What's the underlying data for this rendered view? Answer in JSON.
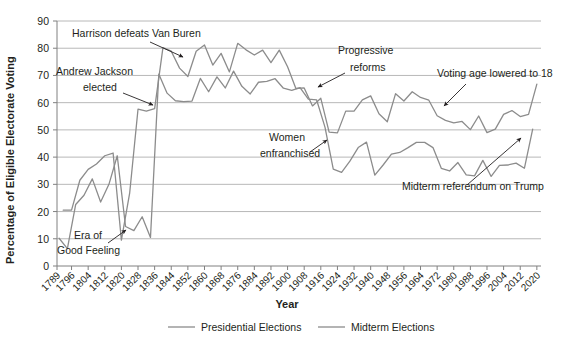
{
  "chart_data": {
    "type": "line",
    "title": "",
    "xlabel": "Year",
    "ylabel": "Percentage of Eligible Electorate Voting",
    "ylim": [
      0,
      90
    ],
    "ytick_step": 10,
    "yticks": [
      0,
      10,
      20,
      30,
      40,
      50,
      60,
      70,
      80,
      90
    ],
    "xlim": [
      1789,
      2022
    ],
    "xticks": [
      1789,
      1796,
      1804,
      1812,
      1820,
      1828,
      1836,
      1844,
      1852,
      1860,
      1868,
      1876,
      1884,
      1892,
      1900,
      1908,
      1916,
      1924,
      1932,
      1940,
      1948,
      1956,
      1964,
      1972,
      1980,
      1988,
      1996,
      2004,
      2012,
      2020
    ],
    "grid": "horizontal",
    "legend_position": "bottom",
    "series": [
      {
        "name": "Presidential Elections",
        "color": "#8c8c8c",
        "x": [
          1792,
          1796,
          1800,
          1804,
          1808,
          1812,
          1816,
          1820,
          1824,
          1828,
          1832,
          1836,
          1840,
          1844,
          1848,
          1852,
          1856,
          1860,
          1864,
          1868,
          1872,
          1876,
          1880,
          1884,
          1888,
          1892,
          1896,
          1900,
          1904,
          1908,
          1912,
          1916,
          1920,
          1924,
          1928,
          1932,
          1936,
          1940,
          1944,
          1948,
          1952,
          1956,
          1960,
          1964,
          1968,
          1972,
          1976,
          1980,
          1984,
          1988,
          1992,
          1996,
          2000,
          2004,
          2008,
          2012,
          2016,
          2020
        ],
        "y": [
          20.5,
          20.5,
          31.5,
          35.5,
          37.5,
          40.5,
          41.5,
          9.5,
          26.9,
          57.6,
          56.9,
          57.8,
          80.2,
          78.9,
          72.7,
          69.6,
          78.9,
          81.2,
          73.8,
          78.1,
          71.3,
          81.8,
          79.4,
          77.5,
          79.3,
          74.7,
          79.3,
          73.2,
          65.2,
          65.4,
          58.8,
          61.6,
          49.2,
          48.9,
          56.9,
          56.9,
          61.0,
          62.5,
          55.9,
          53.0,
          63.3,
          60.6,
          64.0,
          61.9,
          60.9,
          55.2,
          53.5,
          52.6,
          53.1,
          50.1,
          55.1,
          49.0,
          50.3,
          55.7,
          57.1,
          54.9,
          55.7,
          66.8
        ]
      },
      {
        "name": "Midterm Elections",
        "color": "#8c8c8c",
        "x": [
          1790,
          1794,
          1798,
          1802,
          1806,
          1810,
          1814,
          1818,
          1822,
          1826,
          1830,
          1834,
          1838,
          1842,
          1846,
          1850,
          1854,
          1858,
          1862,
          1866,
          1870,
          1874,
          1878,
          1882,
          1886,
          1890,
          1894,
          1898,
          1902,
          1906,
          1910,
          1914,
          1918,
          1922,
          1926,
          1930,
          1934,
          1938,
          1942,
          1946,
          1950,
          1954,
          1958,
          1962,
          1966,
          1970,
          1974,
          1978,
          1982,
          1986,
          1990,
          1994,
          1998,
          2002,
          2006,
          2010,
          2014,
          2018
        ],
        "y": [
          10.2,
          6.4,
          22.6,
          26.0,
          32.0,
          23.5,
          30.0,
          40.5,
          14.5,
          13.0,
          18.1,
          10.5,
          70.5,
          63.5,
          60.7,
          60.4,
          60.6,
          68.9,
          64.0,
          69.5,
          65.4,
          71.6,
          66.0,
          63.2,
          67.5,
          67.8,
          68.8,
          65.3,
          64.5,
          65.5,
          61.3,
          61.0,
          51.0,
          35.6,
          34.4,
          38.5,
          43.5,
          45.5,
          33.4,
          37.1,
          41.1,
          41.7,
          43.5,
          45.4,
          45.4,
          43.5,
          35.9,
          34.9,
          38.0,
          33.5,
          33.1,
          38.8,
          32.9,
          37.0,
          37.1,
          37.8,
          35.9,
          50.3
        ]
      }
    ],
    "annotations": [
      {
        "id": "harrison",
        "text": "Harrison defeats Van Buren",
        "x_px": 72,
        "y_px": 37
      },
      {
        "id": "jackson-line1",
        "text": "Andrew Jackson",
        "x_px": 56,
        "y_px": 75
      },
      {
        "id": "jackson-line2",
        "text": "elected",
        "x_px": 83,
        "y_px": 91
      },
      {
        "id": "era-line1",
        "text": "Era of",
        "x_px": 74,
        "y_px": 239
      },
      {
        "id": "era-line2",
        "text": "Good Feeling",
        "x_px": 57,
        "y_px": 254
      },
      {
        "id": "women-line1",
        "text": "Women",
        "x_px": 269,
        "y_px": 141
      },
      {
        "id": "women-line2",
        "text": "enfranchised",
        "x_px": 260,
        "y_px": 157
      },
      {
        "id": "progressive-line1",
        "text": "Progressive",
        "x_px": 338,
        "y_px": 54
      },
      {
        "id": "progressive-line2",
        "text": "reforms",
        "x_px": 350,
        "y_px": 71
      },
      {
        "id": "voting-age",
        "text": "Voting age lowered to 18",
        "x_px": 437,
        "y_px": 77
      },
      {
        "id": "trump",
        "text": "Midterm referendum on Trump",
        "x_px": 402,
        "y_px": 190
      }
    ],
    "legend": [
      {
        "label": "Presidential Elections"
      },
      {
        "label": "Midterm Elections"
      }
    ]
  },
  "axis": {
    "ylabel": "Percentage of Eligible Electorate Voting",
    "xlabel": "Year",
    "yticks": [
      "90",
      "80",
      "70",
      "60",
      "50",
      "40",
      "30",
      "20",
      "10",
      "0"
    ],
    "xticks": [
      "1789",
      "1796",
      "1804",
      "1812",
      "1820",
      "1828",
      "1836",
      "1844",
      "1852",
      "1860",
      "1868",
      "1876",
      "1884",
      "1892",
      "1900",
      "1908",
      "1916",
      "1924",
      "1932",
      "1940",
      "1948",
      "1956",
      "1964",
      "1972",
      "1980",
      "1988",
      "1996",
      "2004",
      "2012",
      "2020"
    ]
  },
  "colors": {
    "series": "#8c8c8c",
    "gridline": "#a6a6a6",
    "text": "#231f20",
    "background": "#ffffff"
  }
}
